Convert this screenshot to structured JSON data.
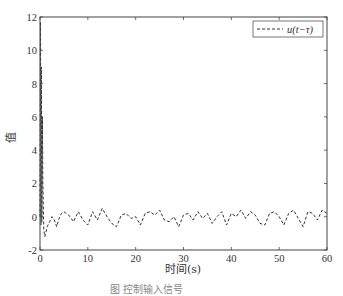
{
  "chart_data": {
    "type": "line",
    "title": "",
    "xlabel": "时间(s)",
    "ylabel": "值",
    "xlim": [
      0,
      60
    ],
    "ylim": [
      -2,
      12
    ],
    "xticks": [
      0,
      10,
      20,
      30,
      40,
      50,
      60
    ],
    "yticks": [
      -2,
      0,
      2,
      4,
      6,
      8,
      10,
      12
    ],
    "grid": false,
    "legend": {
      "position": "upper right",
      "entries": [
        "u(t−τ)"
      ]
    },
    "series": [
      {
        "name": "u(t−τ)",
        "style": "dashed",
        "color": "#333333",
        "x": [
          0,
          0.1,
          0.2,
          0.3,
          0.4,
          0.5,
          0.6,
          0.8,
          1.0,
          1.5,
          2.0,
          2.5,
          3.0,
          3.5,
          4.0,
          4.5,
          5.0,
          6.0,
          7.0,
          8.0,
          9.0,
          10.0,
          11.0,
          12.0,
          13.0,
          14.0,
          15.0,
          16.0,
          17.0,
          18.0,
          19.0,
          20.0,
          21.0,
          22.0,
          23.0,
          24.0,
          25.0,
          26.0,
          27.0,
          28.0,
          29.0,
          30.0,
          31.0,
          32.0,
          33.0,
          34.0,
          35.0,
          36.0,
          37.0,
          38.0,
          39.0,
          40.0,
          41.0,
          42.0,
          43.0,
          44.0,
          45.0,
          46.0,
          47.0,
          48.0,
          49.0,
          50.0,
          51.0,
          52.0,
          53.0,
          54.0,
          55.0,
          56.0,
          57.0,
          58.0,
          59.0,
          60.0
        ],
        "y": [
          0,
          11.7,
          -0.5,
          9.0,
          -0.3,
          6.0,
          2.0,
          -0.8,
          -1.2,
          -0.6,
          -0.3,
          0.0,
          -0.2,
          -0.6,
          -0.1,
          0.2,
          0.3,
          0.1,
          -0.3,
          0.3,
          -0.2,
          -0.5,
          0.3,
          -0.2,
          0.5,
          0.0,
          -0.4,
          -0.6,
          0.1,
          0.2,
          -0.1,
          0.0,
          -0.5,
          0.2,
          0.3,
          0.1,
          0.4,
          -0.2,
          -0.3,
          0.0,
          -0.6,
          0.1,
          0.2,
          -0.2,
          0.3,
          -0.1,
          0.2,
          -0.4,
          0.0,
          0.3,
          -0.5,
          0.2,
          0.0,
          0.4,
          -0.1,
          0.3,
          0.1,
          -0.4,
          -0.5,
          0.2,
          0.3,
          0.0,
          -0.5,
          0.2,
          0.4,
          -0.1,
          -0.6,
          0.3,
          0.2,
          -0.2,
          0.4,
          0.2
        ]
      }
    ]
  },
  "caption": "图   控制输入信号"
}
